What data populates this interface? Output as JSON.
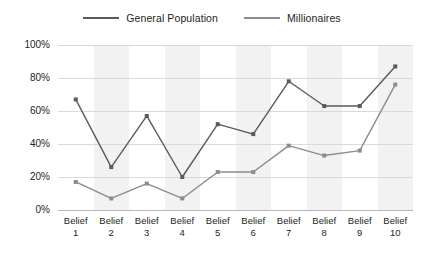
{
  "legend": {
    "position": "top-center",
    "items": [
      {
        "label": "General Population",
        "color": "#5a5a5a",
        "name": "legend-general-population"
      },
      {
        "label": "Millionaires",
        "color": "#8c8c8c",
        "name": "legend-millionaires"
      }
    ]
  },
  "axes": {
    "y_ticks": [
      "0%",
      "20%",
      "40%",
      "60%",
      "80%",
      "100%"
    ],
    "x_labels": [
      {
        "line1": "Belief",
        "line2": "1"
      },
      {
        "line1": "Belief",
        "line2": "2"
      },
      {
        "line1": "Belief",
        "line2": "3"
      },
      {
        "line1": "Belief",
        "line2": "4"
      },
      {
        "line1": "Belief",
        "line2": "5"
      },
      {
        "line1": "Belief",
        "line2": "6"
      },
      {
        "line1": "Belief",
        "line2": "7"
      },
      {
        "line1": "Belief",
        "line2": "8"
      },
      {
        "line1": "Belief",
        "line2": "9"
      },
      {
        "line1": "Belief",
        "line2": "10"
      }
    ]
  },
  "style": {
    "band_color": "#f2f2f2",
    "gridline_color": "#d9d9d9",
    "axis_color": "#b8b8b8",
    "background": "#ffffff",
    "text_color": "#231f20"
  },
  "chart_data": {
    "type": "line",
    "title": "",
    "subtitle": "",
    "xlabel": "",
    "ylabel": "",
    "ylim": [
      0,
      100
    ],
    "ytick_values": [
      0,
      20,
      40,
      60,
      80,
      100
    ],
    "ytick_labels": [
      "0%",
      "20%",
      "40%",
      "60%",
      "80%",
      "100%"
    ],
    "grid": true,
    "legend_position": "top-center",
    "categories": [
      "Belief 1",
      "Belief 2",
      "Belief 3",
      "Belief 4",
      "Belief 5",
      "Belief 6",
      "Belief 7",
      "Belief 8",
      "Belief 9",
      "Belief 10"
    ],
    "series": [
      {
        "name": "General Population",
        "color": "#5a5a5a",
        "marker": "square",
        "values": [
          67,
          26,
          57,
          20,
          52,
          46,
          78,
          63,
          63,
          87
        ]
      },
      {
        "name": "Millionaires",
        "color": "#8c8c8c",
        "marker": "square",
        "values": [
          17,
          7,
          16,
          7,
          23,
          23,
          39,
          33,
          36,
          76
        ]
      }
    ]
  }
}
